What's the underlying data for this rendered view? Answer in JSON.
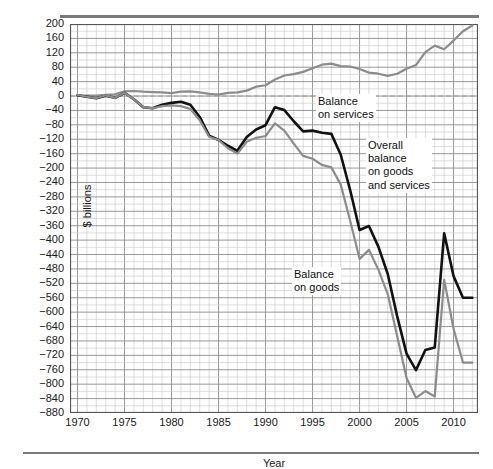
{
  "chart_data": {
    "type": "line",
    "title": "",
    "xlabel": "Year",
    "ylabel": "$ billions",
    "xlim": [
      1969.2,
      2012.6
    ],
    "ylim": [
      -880,
      200
    ],
    "grid": true,
    "grid_major_y_step": 40,
    "grid_minor_x_step": 1,
    "grid_major_x_step": 5,
    "legend_position": "inline-annotations",
    "y_ticks": [
      200,
      160,
      120,
      80,
      40,
      0,
      -40,
      -80,
      -120,
      -160,
      -200,
      -240,
      -280,
      -320,
      -360,
      -400,
      -440,
      -480,
      -520,
      -560,
      -600,
      -640,
      -680,
      -720,
      -760,
      -800,
      -840,
      -880
    ],
    "x_ticks": [
      1970,
      1975,
      1980,
      1985,
      1990,
      1995,
      2000,
      2005,
      2010
    ],
    "x": [
      1970,
      1971,
      1972,
      1973,
      1974,
      1975,
      1976,
      1977,
      1978,
      1979,
      1980,
      1981,
      1982,
      1983,
      1984,
      1985,
      1986,
      1987,
      1988,
      1989,
      1990,
      1991,
      1992,
      1993,
      1994,
      1995,
      1996,
      1997,
      1998,
      1999,
      2000,
      2001,
      2002,
      2003,
      2004,
      2005,
      2006,
      2007,
      2008,
      2009,
      2010,
      2011,
      2012
    ],
    "series": [
      {
        "name": "Balance on services",
        "color": "#8c8c8c",
        "width": 2.2,
        "values": [
          1,
          1,
          1,
          3,
          5,
          13,
          14,
          12,
          11,
          10,
          8,
          12,
          13,
          10,
          6,
          4,
          9,
          10,
          15,
          26,
          30,
          46,
          57,
          61,
          67,
          77,
          87,
          90,
          83,
          82,
          75,
          65,
          62,
          56,
          62,
          76,
          86,
          122,
          140,
          130,
          154,
          180,
          196
        ],
        "note": "Upper gray line; rises steadily after 1985 to about 190 at the right edge"
      },
      {
        "name": "Overall balance on goods and services",
        "color": "#111111",
        "width": 2.6,
        "values": [
          2,
          -2,
          -6,
          1,
          -5,
          9,
          -9,
          -31,
          -34,
          -24,
          -19,
          -16,
          -24,
          -58,
          -110,
          -122,
          -138,
          -152,
          -114,
          -93,
          -81,
          -31,
          -39,
          -70,
          -98,
          -96,
          -102,
          -105,
          -163,
          -261,
          -372,
          -361,
          -418,
          -494,
          -611,
          -715,
          -761,
          -705,
          -698,
          -381,
          -500,
          -560,
          -560
        ],
        "note": "Heavy black line"
      },
      {
        "name": "Balance on goods",
        "color": "#8c8c8c",
        "width": 2.2,
        "values": [
          3,
          -2,
          -6,
          2,
          -5,
          9,
          -9,
          -31,
          -34,
          -28,
          -26,
          -28,
          -36,
          -67,
          -113,
          -122,
          -145,
          -160,
          -127,
          -116,
          -111,
          -76,
          -96,
          -132,
          -166,
          -174,
          -191,
          -198,
          -246,
          -346,
          -452,
          -427,
          -482,
          -550,
          -666,
          -783,
          -838,
          -819,
          -834,
          -510,
          -646,
          -740,
          -740
        ],
        "note": "Lower gray line"
      }
    ],
    "annotations": [
      {
        "id": "services",
        "text_lines": [
          "Balance",
          "on services"
        ],
        "x": 1988,
        "y": 25
      },
      {
        "id": "overall",
        "text_lines": [
          "Overall",
          "balance",
          "on goods",
          "and services"
        ],
        "x": 1993,
        "y": -110
      },
      {
        "id": "goods",
        "text_lines": [
          "Balance",
          "on goods"
        ],
        "x": 1991,
        "y": -440
      }
    ]
  },
  "axis": {
    "ylabel": "$ billions",
    "xlabel": "Year",
    "y_tick_labels": [
      "200",
      "160",
      "120",
      "80",
      "40",
      "0",
      "−40",
      "−80",
      "−120",
      "−160",
      "−200",
      "−240",
      "−280",
      "−320",
      "−360",
      "−400",
      "−440",
      "−480",
      "−520",
      "−560",
      "−600",
      "−640",
      "−680",
      "−720",
      "−760",
      "−800",
      "−840",
      "−880"
    ],
    "x_tick_labels": [
      "1970",
      "1975",
      "1980",
      "1985",
      "1990",
      "1995",
      "2000",
      "2005",
      "2010"
    ]
  },
  "annotations": {
    "services_line1": "Balance",
    "services_line2": "on services",
    "overall_line1": "Overall",
    "overall_line2": "balance",
    "overall_line3": "on goods",
    "overall_line4": "and services",
    "goods_line1": "Balance",
    "goods_line2": "on goods"
  },
  "colors": {
    "series_black": "#111111",
    "series_gray": "#8c8c8c",
    "grid_major": "#8d8d8d",
    "grid_minor": "#c8c8c8",
    "frame": "#555555",
    "rule": "#7b7b7b",
    "background": "#ffffff"
  }
}
